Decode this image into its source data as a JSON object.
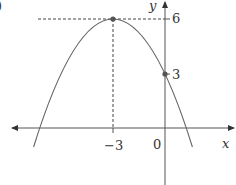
{
  "diagram": {
    "part_marker": ")",
    "equation_hint": "parabola opening downward",
    "axes": {
      "x_label": "x",
      "y_label": "y",
      "origin_label": "0"
    },
    "vertex": {
      "x": -3,
      "y": 6,
      "x_label": "−3",
      "y_label": "6"
    },
    "y_intercept": {
      "x": 0,
      "y": 3,
      "label": "3"
    },
    "colors": {
      "curve": "#666666",
      "axis": "#555555",
      "point": "#555555",
      "dashed": "#444444",
      "text": "#333333"
    }
  }
}
